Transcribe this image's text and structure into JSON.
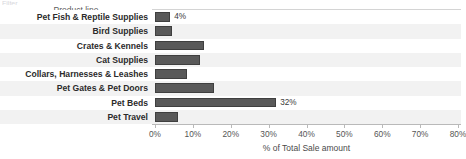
{
  "top_sliver_text": "Filter",
  "column_header": "Product line",
  "chart_data": {
    "type": "bar",
    "orientation": "horizontal",
    "title": "",
    "xlabel": "% of Total Sale amount",
    "ylabel": "Product line",
    "categories": [
      "Pet Fish & Reptile Supplies",
      "Bird Supplies",
      "Crates & Kennels",
      "Cat Supplies",
      "Collars, Harnesses & Leashes",
      "Pet Gates & Pet Doors",
      "Pet Beds",
      "Pet Travel"
    ],
    "values": [
      4,
      4.5,
      13,
      12,
      8.5,
      15.5,
      32,
      6
    ],
    "value_labels": [
      "4%",
      "",
      "",
      "",
      "",
      "",
      "32%",
      ""
    ],
    "xlim": [
      0,
      80
    ],
    "xticks": [
      0,
      10,
      20,
      30,
      40,
      50,
      60,
      70,
      80
    ],
    "xticklabels": [
      "0%",
      "10%",
      "20%",
      "30%",
      "40%",
      "50%",
      "60%",
      "70%",
      "80%"
    ],
    "grid": false,
    "legend": "none",
    "bar_color": "#595959",
    "bar_border_color": "#3f3f3f",
    "alt_row_color": "#f2f2f2",
    "frame_color": "#d4d4d4"
  }
}
